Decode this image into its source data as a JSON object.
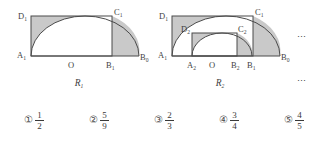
{
  "figures": [
    {
      "name": "R1",
      "caption": "R₁",
      "points": [
        {
          "id": "D1",
          "base": "D",
          "sub": "1"
        },
        {
          "id": "C1",
          "base": "C",
          "sub": "1"
        },
        {
          "id": "A1",
          "base": "A",
          "sub": "1"
        },
        {
          "id": "O",
          "base": "O",
          "sub": ""
        },
        {
          "id": "B1",
          "base": "B",
          "sub": "1"
        },
        {
          "id": "B0",
          "base": "B",
          "sub": "0"
        }
      ]
    },
    {
      "name": "R2",
      "caption": "R₂",
      "points": [
        {
          "id": "D1",
          "base": "D",
          "sub": "1"
        },
        {
          "id": "D2",
          "base": "D",
          "sub": "2"
        },
        {
          "id": "C1",
          "base": "C",
          "sub": "1"
        },
        {
          "id": "C2",
          "base": "C",
          "sub": "2"
        },
        {
          "id": "A1",
          "base": "A",
          "sub": "1"
        },
        {
          "id": "A2",
          "base": "A",
          "sub": "2"
        },
        {
          "id": "O",
          "base": "O",
          "sub": ""
        },
        {
          "id": "B2",
          "base": "B",
          "sub": "2"
        },
        {
          "id": "B1",
          "base": "B",
          "sub": "1"
        },
        {
          "id": "B0",
          "base": "B",
          "sub": "0"
        }
      ]
    }
  ],
  "labels": {
    "fig1": {
      "D1": "D",
      "D1_sub": "1",
      "C1": "C",
      "C1_sub": "1",
      "A1": "A",
      "A1_sub": "1",
      "O": "O",
      "B1": "B",
      "B1_sub": "1",
      "B0": "B",
      "B0_sub": "0",
      "caption": "R",
      "caption_sub": "1"
    },
    "fig2": {
      "D1": "D",
      "D1_sub": "1",
      "D2": "D",
      "D2_sub": "2",
      "C1": "C",
      "C1_sub": "1",
      "C2": "C",
      "C2_sub": "2",
      "A1": "A",
      "A1_sub": "1",
      "A2": "A",
      "A2_sub": "2",
      "O": "O",
      "B2": "B",
      "B2_sub": "2",
      "B1": "B",
      "B1_sub": "1",
      "B0": "B",
      "B0_sub": "0",
      "caption": "R",
      "caption_sub": "2"
    }
  },
  "ellipsis": {
    "top": "⋯",
    "bottom": "⋯"
  },
  "choices": [
    {
      "marker": "①",
      "numerator": "1",
      "denominator": "2"
    },
    {
      "marker": "②",
      "numerator": "5",
      "denominator": "9"
    },
    {
      "marker": "③",
      "numerator": "2",
      "denominator": "3"
    },
    {
      "marker": "④",
      "numerator": "3",
      "denominator": "4"
    },
    {
      "marker": "⑤",
      "numerator": "4",
      "denominator": "5"
    }
  ],
  "colors": {
    "shade": "#c9c9c9",
    "stroke": "#4a4a4a",
    "text": "#3a3a3a",
    "background": "#ffffff"
  }
}
